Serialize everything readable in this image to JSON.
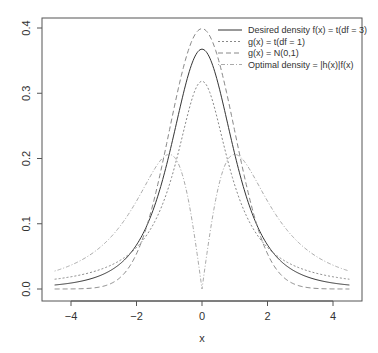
{
  "chart_data": {
    "type": "line",
    "title": "",
    "xlabel": "x",
    "ylabel": "",
    "xlim": [
      -4.5,
      4.5
    ],
    "ylim": [
      0,
      0.4
    ],
    "x_ticks": [
      "-4",
      "-2",
      "0",
      "2",
      "4"
    ],
    "y_ticks": [
      "0.0",
      "0.1",
      "0.2",
      "0.3",
      "0.4"
    ],
    "grid": false,
    "legend_position": "top-right",
    "series": [
      {
        "name": "Desired density f(x) = t(df = 3)",
        "style": "solid",
        "color": "#333333",
        "x": [
          -4.5,
          -4,
          -3,
          -2,
          -1.5,
          -1,
          -0.5,
          0,
          0.5,
          1,
          1.5,
          2,
          3,
          4,
          4.5
        ],
        "values": [
          0.0065,
          0.0092,
          0.023,
          0.0675,
          0.122,
          0.2067,
          0.3151,
          0.3676,
          0.3151,
          0.2067,
          0.122,
          0.0675,
          0.023,
          0.0092,
          0.0065
        ]
      },
      {
        "name": "g(x) = t(df = 1)",
        "style": "dotted",
        "color": "#888888",
        "x": [
          -4.5,
          -4,
          -3,
          -2,
          -1.5,
          -1,
          -0.5,
          0,
          0.5,
          1,
          1.5,
          2,
          3,
          4,
          4.5
        ],
        "values": [
          0.015,
          0.0187,
          0.0318,
          0.0637,
          0.0979,
          0.1592,
          0.2546,
          0.3183,
          0.2546,
          0.1592,
          0.0979,
          0.0637,
          0.0318,
          0.0187,
          0.015
        ]
      },
      {
        "name": "g(x) = N(0,1)",
        "style": "dashed",
        "color": "#888888",
        "x": [
          -4.5,
          -4,
          -3,
          -2,
          -1.5,
          -1,
          -0.5,
          0,
          0.5,
          1,
          1.5,
          2,
          3,
          4,
          4.5
        ],
        "values": [
          0.0,
          0.0001,
          0.0044,
          0.054,
          0.1295,
          0.242,
          0.3521,
          0.3989,
          0.3521,
          0.242,
          0.1295,
          0.054,
          0.0044,
          0.0001,
          0.0
        ]
      },
      {
        "name": "Optimal density = |h(x)|f(x)",
        "style": "dotdash",
        "color": "#aaaaaa",
        "x": [
          -4.5,
          -4,
          -3,
          -2,
          -1.5,
          -1,
          -0.5,
          0,
          0.5,
          1,
          1.5,
          2,
          3,
          4,
          4.5
        ],
        "values": [
          0.029,
          0.036,
          0.064,
          0.122,
          0.166,
          0.207,
          0.157,
          0.0,
          0.157,
          0.207,
          0.166,
          0.122,
          0.064,
          0.036,
          0.029
        ]
      }
    ]
  },
  "legend": {
    "items": [
      {
        "label": "Desired density f(x) = t(df = 3)"
      },
      {
        "label": "g(x) = t(df = 1)"
      },
      {
        "label": "g(x) = N(0,1)"
      },
      {
        "label": "Optimal density = |h(x)|f(x)"
      }
    ]
  },
  "axes": {
    "x_title": "x",
    "x_ticks": [
      {
        "value": -4,
        "label": "-4"
      },
      {
        "value": -2,
        "label": "-2"
      },
      {
        "value": 0,
        "label": "0"
      },
      {
        "value": 2,
        "label": "2"
      },
      {
        "value": 4,
        "label": "4"
      }
    ],
    "y_ticks": [
      {
        "value": 0.0,
        "label": "0.0"
      },
      {
        "value": 0.1,
        "label": "0.1"
      },
      {
        "value": 0.2,
        "label": "0.2"
      },
      {
        "value": 0.3,
        "label": "0.3"
      },
      {
        "value": 0.4,
        "label": "0.4"
      }
    ]
  }
}
